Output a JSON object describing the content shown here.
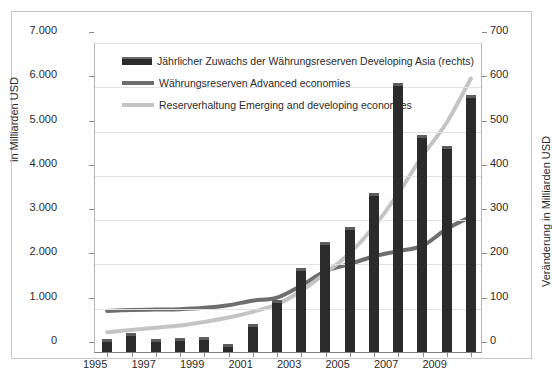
{
  "axes": {
    "left_label": "in Milliarden USD",
    "right_label": "Veränderung in Milliarden USD",
    "left_ticks": [
      "7.000",
      "6.000",
      "5.000",
      "4.000",
      "3.000",
      "2.000",
      "1.000",
      "0"
    ],
    "right_ticks": [
      "700",
      "600",
      "500",
      "400",
      "300",
      "200",
      "100",
      "0"
    ],
    "x_ticks": [
      "1995",
      "1997",
      "1999",
      "2001",
      "2003",
      "2005",
      "2007",
      "2009"
    ]
  },
  "legend": {
    "items": [
      {
        "label": "Jährlicher Zuwachs der Währungsreserven Developing Asia (rechts)",
        "marker": "bar-swatch",
        "color": "#2b2b2b"
      },
      {
        "label": "Währungsreserven Advanced economies",
        "marker": "line-swatch-dark",
        "color": "#6e6e6e"
      },
      {
        "label": "Reserverhaltung Emerging and developing economies",
        "marker": "line-swatch-light",
        "color": "#c4c4c4"
      }
    ]
  },
  "chart_data": {
    "type": "bar",
    "title": "",
    "xlabel": "",
    "ylabel": "in Milliarden USD",
    "y2label": "Veränderung in Milliarden USD",
    "ylim": [
      0,
      7000
    ],
    "y2lim": [
      0,
      700
    ],
    "grid": true,
    "legend_position": "inside-top-left",
    "categories": [
      "1995",
      "1996",
      "1997",
      "1998",
      "1999",
      "2000",
      "2001",
      "2002",
      "2003",
      "2004",
      "2005",
      "2006",
      "2007",
      "2008",
      "2009",
      "2010"
    ],
    "series": [
      {
        "name": "Jährlicher Zuwachs der Währungsreserven Developing Asia (rechts)",
        "type": "bar",
        "axis": "right",
        "color": "#2b2b2b",
        "values": [
          30,
          42,
          30,
          31,
          34,
          18,
          63,
          117,
          190,
          248,
          283,
          358,
          608,
          490,
          465,
          580
        ]
      },
      {
        "name": "Währungsreserven Advanced economies",
        "type": "line",
        "axis": "left",
        "color": "#6e6e6e",
        "values": [
          950,
          970,
          980,
          990,
          1020,
          1080,
          1180,
          1250,
          1520,
          1850,
          2010,
          2180,
          2300,
          2420,
          2800,
          3080
        ]
      },
      {
        "name": "Reserverhaltung Emerging and developing economies",
        "type": "line",
        "axis": "left",
        "color": "#c4c4c4",
        "values": [
          470,
          520,
          570,
          620,
          700,
          800,
          930,
          1100,
          1400,
          1800,
          2250,
          2850,
          3600,
          4450,
          5200,
          6200
        ]
      }
    ]
  },
  "top_artifact": "o o o o    o o"
}
